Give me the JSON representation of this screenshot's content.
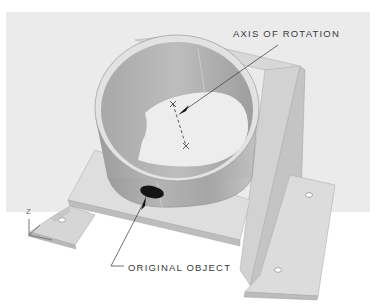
{
  "figure": {
    "type": "isometric-cad-illustration",
    "callouts": {
      "axis_of_rotation": "AXIS OF ROTATION",
      "original_object": "ORIGINAL OBJECT"
    },
    "ucs_icon": {
      "axis_label": "Z"
    },
    "colors": {
      "background": "#ebebeb",
      "top_strip": "#ffffff",
      "bracket_light": "#dcdcdc",
      "bracket_mid": "#c9c9c9",
      "bracket_dark": "#b5b5b5",
      "cylinder_outer": "#a9a9a9",
      "cylinder_inner": "#b9b9b9",
      "rim": "#e2e2e2",
      "original_object": "#111111",
      "line": "#333333"
    }
  }
}
